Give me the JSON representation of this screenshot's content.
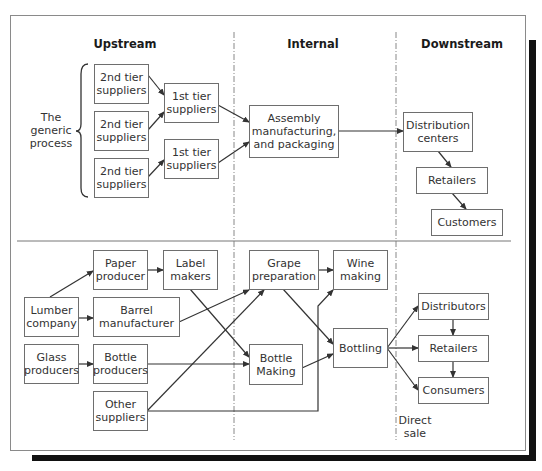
{
  "headers": {
    "upstream": "Upstream",
    "internal": "Internal",
    "downstream": "Downstream"
  },
  "generic": {
    "side_label": "The\ngeneric\nprocess",
    "second_tier": [
      "2nd tier\nsuppliers",
      "2nd tier\nsuppliers",
      "2nd tier\nsuppliers"
    ],
    "first_tier": [
      "1st tier\nsuppliers",
      "1st tier\nsuppliers"
    ],
    "assembly": "Assembly\nmanufacturing,\nand packaging",
    "distribution": "Distribution\ncenters",
    "retailers": "Retailers",
    "customers": "Customers"
  },
  "wine": {
    "paper_producer": "Paper\nproducer",
    "label_makers": "Label\nmakers",
    "lumber_company": "Lumber\ncompany",
    "barrel_manufacturer": "Barrel\nmanufacturer",
    "glass_producers": "Glass\nproducers",
    "bottle_producers": "Bottle\nproducers",
    "other_suppliers": "Other\nsuppliers",
    "grape_preparation": "Grape\npreparation",
    "wine_making": "Wine\nmaking",
    "bottle_making": "Bottle\nMaking",
    "bottling": "Bottling",
    "distributors": "Distributors",
    "retailers": "Retailers",
    "consumers": "Consumers",
    "direct_sale": "Direct\nsale"
  },
  "colors": {
    "line": "#333333",
    "box_border": "#6e6e6e",
    "shadow": "#111111"
  }
}
